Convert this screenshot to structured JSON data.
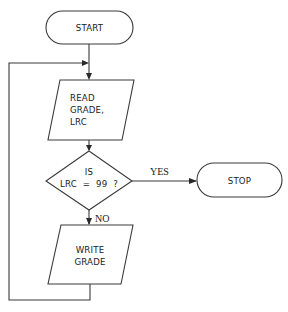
{
  "diagram": {
    "type": "flowchart",
    "nodes": {
      "start": {
        "shape": "terminal",
        "label": "START"
      },
      "read": {
        "shape": "parallelogram",
        "lines": [
          "READ",
          "GRADE,",
          "LRC"
        ]
      },
      "decision": {
        "shape": "diamond",
        "lines": [
          "IS",
          "LRC  =  99  ?"
        ]
      },
      "stop": {
        "shape": "terminal",
        "label": "STOP"
      },
      "write": {
        "shape": "parallelogram",
        "lines": [
          "WRITE",
          "GRADE"
        ]
      }
    },
    "edges": {
      "yes_label": "YES",
      "no_label": "NO"
    },
    "colors": {
      "stroke": "#3a3a3a",
      "background": "#ffffff",
      "text": "#222222"
    }
  }
}
